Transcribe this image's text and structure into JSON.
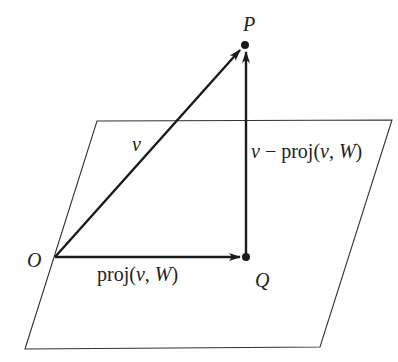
{
  "diagram": {
    "type": "vector-projection-onto-plane",
    "colors": {
      "stroke": "#1a1a1a",
      "plane": "#333333",
      "background": "#ffffff"
    },
    "plane": {
      "name": "W"
    },
    "points": {
      "O": {
        "label": "O"
      },
      "P": {
        "label": "P"
      },
      "Q": {
        "label": "Q"
      }
    },
    "vectors": {
      "v": {
        "label": "v",
        "from": "O",
        "to": "P"
      },
      "proj": {
        "label_prefix": "proj(",
        "label_var": "v",
        "label_sep": ", ",
        "label_space": "W",
        "label_suffix": ")",
        "from": "O",
        "to": "Q"
      },
      "residual": {
        "label_var": "v",
        "label_minus": " − proj(",
        "label_var2": "v",
        "label_sep": ", ",
        "label_space": "W",
        "label_suffix": ")",
        "from": "Q",
        "to": "P"
      }
    }
  }
}
